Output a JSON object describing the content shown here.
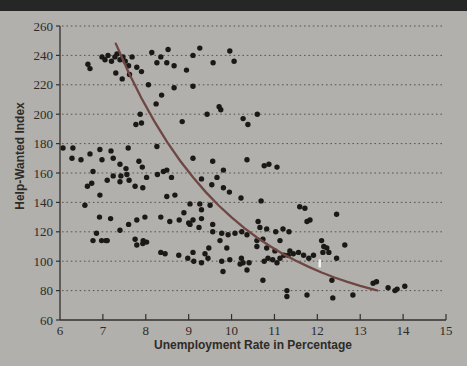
{
  "window": {
    "top_bar_color": "#262626"
  },
  "colors": {
    "background": "#b1b0ac",
    "axis": "#33302c",
    "grid": "#5a554f",
    "point": "#1b1917",
    "curve": "#6f4742",
    "text": "#2f2b27",
    "artifact": "#f2f1ee"
  },
  "chart_data": {
    "type": "scatter",
    "title": "",
    "xlabel": "Unemployment Rate in Percentage",
    "ylabel": "Help-Wanted Index",
    "xlim": [
      6,
      15
    ],
    "ylim": [
      60,
      260
    ],
    "x_ticks": [
      6,
      7,
      8,
      9,
      10,
      11,
      12,
      13,
      14,
      15
    ],
    "y_ticks": [
      60,
      80,
      100,
      120,
      140,
      160,
      180,
      200,
      220,
      240,
      260
    ],
    "grid": "horizontal dotted gridlines at each y tick, left and bottom axes only",
    "legend": "none",
    "points": [
      [
        6.65,
        234
      ],
      [
        6.7,
        231
      ],
      [
        6.98,
        239
      ],
      [
        7.05,
        237
      ],
      [
        7.12,
        240
      ],
      [
        7.2,
        236
      ],
      [
        7.28,
        239
      ],
      [
        7.33,
        241
      ],
      [
        7.4,
        237
      ],
      [
        7.47,
        239
      ],
      [
        7.52,
        236
      ],
      [
        7.6,
        233
      ],
      [
        7.68,
        239
      ],
      [
        7.79,
        232
      ],
      [
        7.3,
        228
      ],
      [
        7.45,
        224
      ],
      [
        7.62,
        227
      ],
      [
        7.9,
        229
      ],
      [
        8.14,
        242
      ],
      [
        8.26,
        235
      ],
      [
        8.35,
        239
      ],
      [
        8.49,
        235
      ],
      [
        8.52,
        244
      ],
      [
        8.66,
        233
      ],
      [
        8.95,
        230
      ],
      [
        9.26,
        245
      ],
      [
        9.57,
        235
      ],
      [
        9.96,
        243
      ],
      [
        10.06,
        236
      ],
      [
        9.1,
        240
      ],
      [
        9.1,
        219
      ],
      [
        9.43,
        200
      ],
      [
        9.71,
        205
      ],
      [
        9.75,
        203
      ],
      [
        10.27,
        197
      ],
      [
        10.38,
        193
      ],
      [
        10.6,
        200
      ],
      [
        8.06,
        220
      ],
      [
        8.66,
        218
      ],
      [
        8.37,
        213
      ],
      [
        8.24,
        207
      ],
      [
        7.87,
        200
      ],
      [
        7.9,
        194
      ],
      [
        7.77,
        193
      ],
      [
        8.85,
        195
      ],
      [
        6.07,
        177
      ],
      [
        6.28,
        170
      ],
      [
        6.3,
        177
      ],
      [
        6.49,
        169
      ],
      [
        6.7,
        173
      ],
      [
        6.93,
        176
      ],
      [
        6.98,
        169
      ],
      [
        7.19,
        175
      ],
      [
        7.24,
        170
      ],
      [
        7.4,
        166
      ],
      [
        7.59,
        177
      ],
      [
        7.84,
        168
      ],
      [
        8.26,
        178
      ],
      [
        7.54,
        163
      ],
      [
        7.24,
        158
      ],
      [
        6.77,
        161
      ],
      [
        7.42,
        158
      ],
      [
        6.74,
        153
      ],
      [
        7.1,
        155
      ],
      [
        7.4,
        154
      ],
      [
        7.61,
        155
      ],
      [
        7.56,
        159
      ],
      [
        7.92,
        164
      ],
      [
        8.02,
        157
      ],
      [
        8.27,
        159
      ],
      [
        8.41,
        161
      ],
      [
        8.6,
        157
      ],
      [
        7.75,
        151
      ],
      [
        7.93,
        150
      ],
      [
        6.64,
        151
      ],
      [
        9.1,
        170
      ],
      [
        9.56,
        168
      ],
      [
        10.36,
        169
      ],
      [
        10.76,
        165
      ],
      [
        10.87,
        166
      ],
      [
        11.06,
        164
      ],
      [
        9.81,
        162
      ],
      [
        9.66,
        157
      ],
      [
        9.54,
        152
      ],
      [
        9.81,
        150
      ],
      [
        9.3,
        156
      ],
      [
        8.49,
        162
      ],
      [
        6.58,
        138
      ],
      [
        6.93,
        145
      ],
      [
        6.92,
        130
      ],
      [
        7.18,
        129
      ],
      [
        7.6,
        125
      ],
      [
        7.79,
        128
      ],
      [
        7.98,
        130
      ],
      [
        8.35,
        130
      ],
      [
        8.56,
        127
      ],
      [
        8.78,
        128
      ],
      [
        8.89,
        133
      ],
      [
        8.49,
        144
      ],
      [
        8.68,
        145
      ],
      [
        9.95,
        147
      ],
      [
        10.22,
        143
      ],
      [
        10.69,
        141
      ],
      [
        9.03,
        139
      ],
      [
        9.26,
        139
      ],
      [
        9.5,
        138
      ],
      [
        9.3,
        135
      ],
      [
        11.59,
        137
      ],
      [
        11.71,
        136
      ],
      [
        12.45,
        132
      ],
      [
        9.0,
        126
      ],
      [
        10.62,
        127
      ],
      [
        11.76,
        127
      ],
      [
        11.83,
        128
      ],
      [
        6.85,
        119
      ],
      [
        7.1,
        114
      ],
      [
        7.4,
        121
      ],
      [
        7.75,
        115
      ],
      [
        7.94,
        114
      ],
      [
        6.77,
        114
      ],
      [
        6.97,
        114
      ],
      [
        7.07,
        114
      ],
      [
        7.79,
        111
      ],
      [
        7.93,
        112
      ],
      [
        8.02,
        113
      ],
      [
        8.35,
        106
      ],
      [
        8.45,
        105
      ],
      [
        8.77,
        104
      ],
      [
        8.98,
        102
      ],
      [
        9.1,
        128
      ],
      [
        9.3,
        129
      ],
      [
        9.24,
        123
      ],
      [
        9.03,
        125
      ],
      [
        9.56,
        125
      ],
      [
        9.56,
        120
      ],
      [
        9.77,
        119
      ],
      [
        9.92,
        118
      ],
      [
        10.08,
        119
      ],
      [
        10.24,
        120
      ],
      [
        10.66,
        123
      ],
      [
        10.82,
        122
      ],
      [
        11.03,
        120
      ],
      [
        11.2,
        122
      ],
      [
        11.34,
        120
      ],
      [
        9.73,
        114
      ],
      [
        10.59,
        114
      ],
      [
        10.73,
        115
      ],
      [
        11.13,
        114
      ],
      [
        10.36,
        118
      ],
      [
        9.12,
        100
      ],
      [
        9.3,
        99
      ],
      [
        9.45,
        102
      ],
      [
        9.77,
        100
      ],
      [
        9.89,
        109
      ],
      [
        9.47,
        109
      ],
      [
        9.96,
        101
      ],
      [
        10.23,
        102
      ],
      [
        10.27,
        99
      ],
      [
        10.41,
        99
      ],
      [
        10.2,
        98
      ],
      [
        10.76,
        100
      ],
      [
        10.85,
        102
      ],
      [
        10.96,
        101
      ],
      [
        11.06,
        99
      ],
      [
        11.13,
        102
      ],
      [
        11.22,
        104
      ],
      [
        11.32,
        104
      ],
      [
        11.44,
        105
      ],
      [
        11.56,
        106
      ],
      [
        11.68,
        104
      ],
      [
        11.8,
        102
      ],
      [
        11.91,
        104
      ],
      [
        11.36,
        107
      ],
      [
        11.01,
        107
      ],
      [
        10.82,
        109
      ],
      [
        10.59,
        110
      ],
      [
        9.38,
        105
      ],
      [
        9.1,
        106
      ],
      [
        10.36,
        94
      ],
      [
        9.8,
        93
      ],
      [
        12.1,
        114
      ],
      [
        12.15,
        110
      ],
      [
        12.22,
        109
      ],
      [
        12.13,
        106
      ],
      [
        12.27,
        106
      ],
      [
        12.64,
        111
      ],
      [
        12.45,
        102
      ],
      [
        10.73,
        87
      ],
      [
        11.29,
        80
      ],
      [
        11.29,
        76
      ],
      [
        11.76,
        77
      ],
      [
        12.34,
        87
      ],
      [
        12.36,
        75
      ],
      [
        12.83,
        77
      ],
      [
        13.3,
        85
      ],
      [
        13.38,
        86
      ],
      [
        13.65,
        82
      ],
      [
        13.81,
        80
      ],
      [
        13.86,
        81
      ],
      [
        14.04,
        83
      ]
    ],
    "trend_curve": {
      "description": "downward convex fitted curve from about (7.3, 248) flattening to about (13.4, 80)",
      "points": [
        [
          7.3,
          248.0
        ],
        [
          7.6,
          228.4
        ],
        [
          7.9,
          210.9
        ],
        [
          8.2,
          195.1
        ],
        [
          8.5,
          181.0
        ],
        [
          8.8,
          168.4
        ],
        [
          9.1,
          157.1
        ],
        [
          9.4,
          147.0
        ],
        [
          9.7,
          137.9
        ],
        [
          10.0,
          129.8
        ],
        [
          10.3,
          122.5
        ],
        [
          10.6,
          116.0
        ],
        [
          10.9,
          110.2
        ],
        [
          11.2,
          104.9
        ],
        [
          11.5,
          100.3
        ],
        [
          11.8,
          96.1
        ],
        [
          12.1,
          92.3
        ],
        [
          12.4,
          88.9
        ],
        [
          12.7,
          85.9
        ],
        [
          13.0,
          83.2
        ],
        [
          13.3,
          80.8
        ],
        [
          13.4,
          80.1
        ]
      ]
    },
    "artifact": {
      "x": 12.05,
      "y": 98.5
    }
  }
}
